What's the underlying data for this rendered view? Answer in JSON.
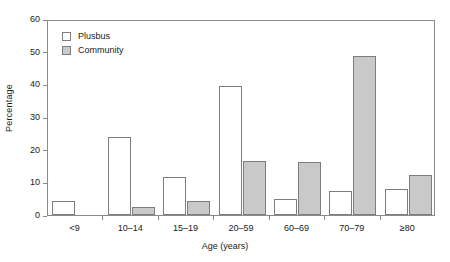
{
  "chart_data": {
    "type": "bar",
    "title": "",
    "xlabel": "Age (years)",
    "ylabel": "Percentage",
    "categories": [
      "<9",
      "10–14",
      "15–19",
      "20–59",
      "60–69",
      "70–79",
      "≥80"
    ],
    "series": [
      {
        "name": "Plusbus",
        "color": "#ffffff",
        "values": [
          4.3,
          24.0,
          11.7,
          39.5,
          5.0,
          7.5,
          8.0
        ]
      },
      {
        "name": "Community",
        "color": "#c9c9c9",
        "values": [
          0,
          2.5,
          4.3,
          16.5,
          16.3,
          48.7,
          12.3
        ]
      }
    ],
    "ylim": [
      0,
      60
    ],
    "yticks": [
      0,
      10,
      20,
      30,
      40,
      50,
      60
    ],
    "ytick_labels": [
      "0",
      "10",
      "20",
      "30",
      "40",
      "50",
      "60"
    ],
    "grid": false,
    "legend_position": "top-left",
    "legend_entries": [
      "Plusbus",
      "Community"
    ]
  },
  "axes": {
    "y_title": "Percentage",
    "x_title": "Age (years)"
  }
}
